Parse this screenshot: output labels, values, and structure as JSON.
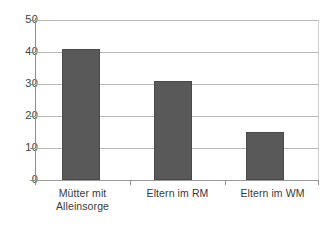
{
  "chart_data": {
    "type": "bar",
    "title": "",
    "subtitle": "",
    "xlabel": "",
    "ylabel": "",
    "categories": [
      "Mütter mit Alleinsorge",
      "Eltern im RM",
      "Eltern im WM"
    ],
    "category_lines": [
      [
        "Mütter mit",
        "Alleinsorge"
      ],
      [
        "Eltern im RM",
        ""
      ],
      [
        "Eltern im WM",
        ""
      ]
    ],
    "values": [
      41,
      31,
      15
    ],
    "ylim": [
      0,
      50
    ],
    "yticks": [
      0,
      10,
      20,
      30,
      40,
      50
    ],
    "ytick_labels": [
      "0",
      "10",
      "20",
      "30",
      "40",
      "50"
    ],
    "grid": true,
    "grid_axis": "y",
    "legend": false,
    "legend_position": "none",
    "series": [
      {
        "name": "",
        "values": [
          41,
          31,
          15
        ],
        "color": "#595959"
      }
    ]
  },
  "colors": {
    "bar_fill": "#595959",
    "bar_stroke": "#4a4a4a",
    "gridline": "#b9b9b9",
    "axis": "#8d8d8d",
    "text": "#3a3a3a",
    "background": "#ffffff"
  }
}
